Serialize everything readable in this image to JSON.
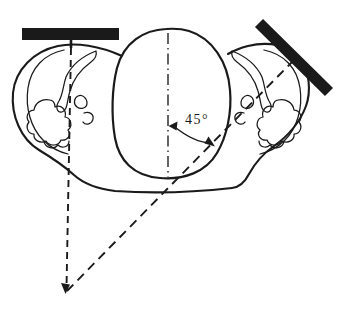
{
  "diagram": {
    "type": "line-drawing",
    "angle_label": "45°",
    "colors": {
      "ink": "#1a1a1a",
      "paper": "#ffffff"
    }
  }
}
